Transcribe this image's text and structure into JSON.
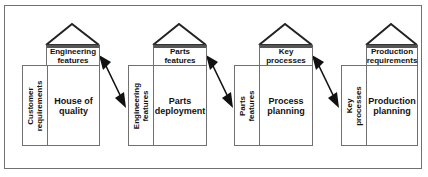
{
  "diagram": {
    "type": "QFD four-phase house of quality flow",
    "houses": [
      {
        "header": "Engineering\nfeatures",
        "side": "Customer\nrequirements",
        "main": "House of\nquality"
      },
      {
        "header": "Parts\nfeatures",
        "side": "Engineering\nfeatures",
        "main": "Parts\ndeployment"
      },
      {
        "header": "Key\nprocesses",
        "side": "Parts\nfeatures",
        "main": "Process\nplanning"
      },
      {
        "header": "Production\nrequirements",
        "side": "Key\nprocesses",
        "main": "Production\nplanning"
      }
    ],
    "connectors": [
      {
        "from": "Engineering features",
        "to": "Engineering features",
        "style": "double-headed arrow"
      },
      {
        "from": "Parts features",
        "to": "Parts features",
        "style": "double-headed arrow"
      },
      {
        "from": "Key processes",
        "to": "Key processes",
        "style": "double-headed arrow"
      }
    ],
    "colors": {
      "line": "#707070",
      "roof": "#222222",
      "arrow": "#111111",
      "text": "#111111",
      "background": "#ffffff"
    }
  }
}
